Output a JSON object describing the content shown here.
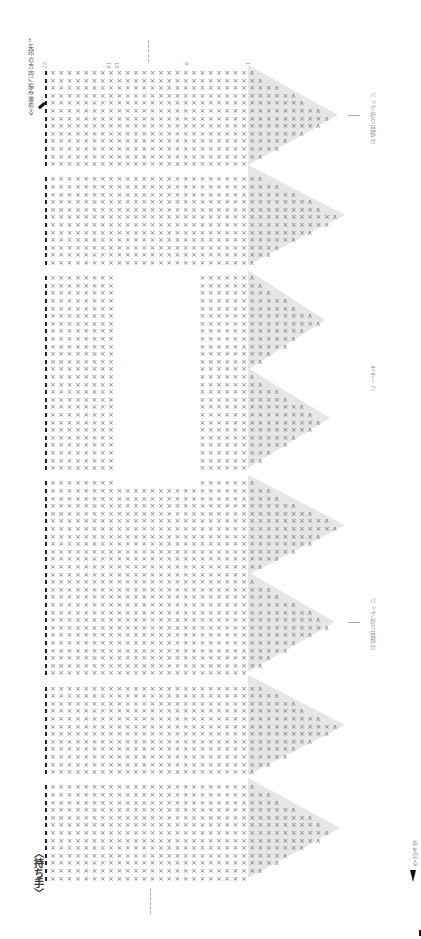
{
  "title": "〈持ち手〉",
  "direction_note": "←矢印の方向に編み進める",
  "labels": {
    "fold_top": "バッグ折り目部分",
    "motif": "モチーフ",
    "fold_bottom": "バッグ折り目部分",
    "cut_yarn": "糸を切る"
  },
  "row_numbers": {
    "start": "27",
    "mid_a": "19",
    "mid_b": "18",
    "mid_c": "8",
    "end": "1"
  },
  "stitch_symbols": {
    "single_crochet": "×",
    "chain": "○",
    "decrease": "∧",
    "edge_mark": "▮"
  },
  "colors": {
    "stitch": "#777777",
    "triangle_shade": "#e6e6e6",
    "row_number": "#e07a7a",
    "label": "#999999"
  },
  "layout": {
    "triangle_centers_y": [
      115,
      215,
      320,
      418,
      525,
      622,
      725,
      828
    ],
    "triangle_tip_x": [
      338,
      345,
      325,
      330,
      345,
      335,
      345,
      340
    ],
    "blank_rect": {
      "x": 110,
      "y": 266,
      "w": 85,
      "h": 220
    }
  }
}
